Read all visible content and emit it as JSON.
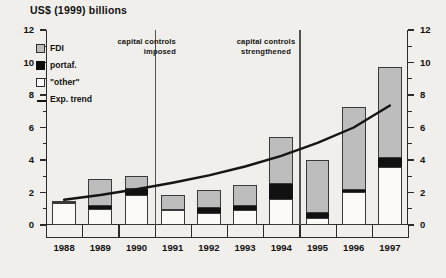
{
  "chart": {
    "title": "US$ (1999) billions",
    "background_color": "#f1efeb"
  },
  "legend": {
    "position": "top-left-inside",
    "items": [
      {
        "key": "fdi",
        "label": "FDI",
        "marker": "square",
        "color": "#bdbdbd"
      },
      {
        "key": "portaf",
        "label": "portaf.",
        "marker": "square",
        "color": "#0d0d0d"
      },
      {
        "key": "other",
        "label": "\"other\"",
        "marker": "square",
        "color": "#ffffff"
      },
      {
        "key": "trend",
        "label": "Exp. trend",
        "marker": "line",
        "color": "#151515"
      }
    ]
  },
  "annotations": [
    {
      "name": "capital-controls-imposed",
      "text_line1": "capital controls",
      "text_line2": "imposed",
      "at_year": 1991
    },
    {
      "name": "capital-controls-strengthened",
      "text_line1": "capital controls",
      "text_line2": "strengthened",
      "at_year": 1995
    }
  ],
  "axes": {
    "y_left": {
      "min": 0,
      "max": 12,
      "major_step": 2,
      "minor_step": 1,
      "ticks": [
        0,
        2,
        4,
        6,
        8,
        10,
        12
      ]
    },
    "y_right": {
      "min": 0,
      "max": 12,
      "major_step": 2,
      "minor_step": 1,
      "ticks": [
        0,
        2,
        4,
        6,
        8,
        10,
        12
      ]
    },
    "x": {
      "categories": [
        1988,
        1989,
        1990,
        1991,
        1992,
        1993,
        1994,
        1995,
        1996,
        1997
      ]
    }
  },
  "chart_data": {
    "type": "bar",
    "title": "US$ (1999) billions",
    "xlabel": "",
    "ylabel": "US$ (1999) billions",
    "ylim": [
      0,
      12
    ],
    "grid": false,
    "stacked": true,
    "legend_position": "top-left-inside",
    "categories": [
      "1988",
      "1989",
      "1990",
      "1991",
      "1992",
      "1993",
      "1994",
      "1995",
      "1996",
      "1997"
    ],
    "series": [
      {
        "name": "\"other\"",
        "color": "#fbfaf7",
        "values": [
          1.35,
          1.0,
          1.85,
          0.9,
          0.75,
          0.9,
          1.6,
          0.45,
          2.05,
          3.55
        ]
      },
      {
        "name": "portaf.",
        "color": "#111111",
        "values": [
          0.1,
          0.15,
          0.35,
          0.0,
          0.3,
          0.25,
          0.9,
          0.3,
          0.1,
          0.6
        ]
      },
      {
        "name": "FDI",
        "color": "#bdbdbd",
        "values": [
          0.05,
          1.7,
          0.8,
          0.95,
          1.1,
          1.3,
          2.9,
          3.25,
          5.1,
          5.55
        ]
      }
    ],
    "totals": [
      1.5,
      2.85,
      3.0,
      1.85,
      2.15,
      2.45,
      5.4,
      4.0,
      7.25,
      9.7
    ],
    "overlay_line": {
      "name": "Exp. trend",
      "type": "line",
      "color": "#151515",
      "x": [
        "1988",
        "1989",
        "1990",
        "1991",
        "1992",
        "1993",
        "1994",
        "1995",
        "1996",
        "1997"
      ],
      "values": [
        1.55,
        1.85,
        2.2,
        2.6,
        3.05,
        3.6,
        4.25,
        5.05,
        6.0,
        7.35
      ]
    },
    "vertical_dividers": [
      {
        "label": "capital controls imposed",
        "between": [
          "1990",
          "1991"
        ]
      },
      {
        "label": "capital controls strengthened",
        "between": [
          "1994",
          "1995"
        ]
      }
    ]
  }
}
